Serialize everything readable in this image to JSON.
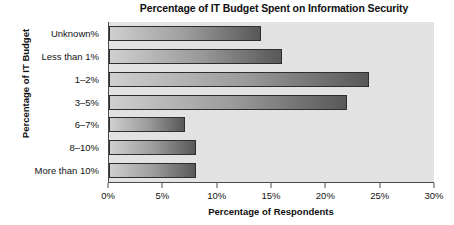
{
  "chart_data": {
    "type": "bar",
    "orientation": "horizontal",
    "title": "Percentage of IT Budget Spent on Information Security",
    "xlabel": "Percentage of Respondents",
    "ylabel": "Percentage of IT Budget",
    "categories": [
      "Unknown%",
      "Less than 1%",
      "1–2%",
      "3–5%",
      "6–7%",
      "8–10%",
      "More than 10%"
    ],
    "values": [
      14,
      16,
      24,
      22,
      7,
      8,
      8
    ],
    "xlim": [
      0,
      30
    ],
    "xticks": [
      0,
      5,
      10,
      15,
      20,
      25,
      30
    ],
    "xtick_labels": [
      "0%",
      "5%",
      "10%",
      "15%",
      "20%",
      "25%",
      "30%"
    ],
    "grid": false,
    "legend": "none",
    "colors": {
      "plot_background": "#e2e2e2",
      "bar_light": "#cfcfcf",
      "bar_dark": "#585858",
      "bar_outline": "#2e2e2e",
      "axis": "#4a4a4a",
      "text": "#121212"
    }
  }
}
